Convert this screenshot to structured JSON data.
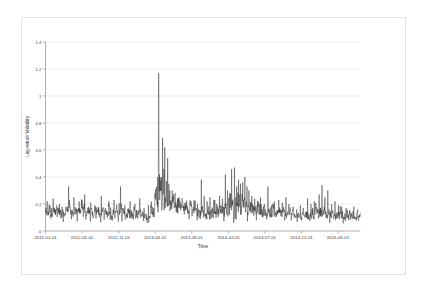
{
  "figure": {
    "background_color": "#ffffff",
    "frame_color": "#e3e3e3",
    "axis_color": "#9a9a9a",
    "grid_color": "#e9e9e9",
    "line_color": "#1a1a1a"
  },
  "chart_data": {
    "type": "line",
    "title": "",
    "xlabel": "Time",
    "ylabel": "Log-return Volatility",
    "ylim": [
      0,
      1.4
    ],
    "yticks": [
      0,
      0.2,
      0.4,
      0.6,
      0.8,
      1,
      1.2,
      1.4
    ],
    "ytick_labels": [
      "0",
      "0.2",
      "0.4",
      "0.6",
      "0.8",
      "1",
      "1.2",
      "1.4"
    ],
    "xticks": [
      0,
      152,
      305,
      456,
      608,
      762,
      912,
      1065,
      1216
    ],
    "xtick_labels": [
      "2012-01-01",
      "2012-06-01",
      "2012-11-01",
      "2013-04-01",
      "2013-09-01",
      "2014-02-01",
      "2014-07-01",
      "2014-12-01",
      "2015-05-01"
    ],
    "xlim": [
      0,
      1310
    ],
    "grid": true,
    "grid_axis": "y",
    "legend": null,
    "series": [
      {
        "name": "Log-return Volatility",
        "color": "#1a1a1a",
        "n_points": 1310,
        "sampling": "daily",
        "notes": "Dense high-frequency volatility series; baseline near 0.10-0.18 with episodic spike clusters.",
        "peak_value": 1.17,
        "peak_x": 470,
        "min_value": 0.055,
        "baseline_mean": 0.14,
        "regimes": [
          {
            "x_start": 0,
            "x_end": 150,
            "base": 0.135,
            "noise": 0.03,
            "spikes": [
              [
                32,
                0.24
              ],
              [
                58,
                0.2
              ],
              [
                96,
                0.33
              ],
              [
                118,
                0.25
              ],
              [
                140,
                0.22
              ]
            ]
          },
          {
            "x_start": 150,
            "x_end": 300,
            "base": 0.13,
            "noise": 0.028,
            "spikes": [
              [
                163,
                0.27
              ],
              [
                188,
                0.21
              ],
              [
                205,
                0.19
              ],
              [
                232,
                0.26
              ],
              [
                262,
                0.2
              ],
              [
                285,
                0.23
              ]
            ]
          },
          {
            "x_start": 300,
            "x_end": 400,
            "base": 0.118,
            "noise": 0.026,
            "spikes": [
              [
                312,
                0.33
              ],
              [
                330,
                0.19
              ],
              [
                352,
                0.22
              ],
              [
                372,
                0.2
              ],
              [
                392,
                0.24
              ]
            ]
          },
          {
            "x_start": 400,
            "x_end": 448,
            "base": 0.105,
            "noise": 0.022,
            "spikes": [
              [
                410,
                0.17
              ],
              [
                428,
                0.19
              ],
              [
                441,
                0.18
              ]
            ]
          },
          {
            "x_start": 448,
            "x_end": 470,
            "base": 0.15,
            "noise": 0.045,
            "spikes": [
              [
                455,
                0.28
              ],
              [
                462,
                0.33
              ],
              [
                467,
                0.4
              ]
            ]
          },
          {
            "x_start": 470,
            "x_end": 478,
            "base": 0.24,
            "noise": 0.07,
            "spikes": [
              [
                471,
                1.17
              ],
              [
                474,
                0.42
              ],
              [
                476,
                0.38
              ]
            ]
          },
          {
            "x_start": 478,
            "x_end": 500,
            "base": 0.215,
            "noise": 0.06,
            "spikes": [
              [
                482,
                0.4
              ],
              [
                487,
                0.69
              ],
              [
                492,
                0.46
              ],
              [
                496,
                0.62
              ]
            ]
          },
          {
            "x_start": 500,
            "x_end": 520,
            "base": 0.195,
            "noise": 0.055,
            "spikes": [
              [
                503,
                0.37
              ],
              [
                508,
                0.54
              ],
              [
                513,
                0.35
              ],
              [
                517,
                0.3
              ]
            ]
          },
          {
            "x_start": 520,
            "x_end": 570,
            "base": 0.16,
            "noise": 0.04,
            "spikes": [
              [
                527,
                0.3
              ],
              [
                538,
                0.26
              ],
              [
                549,
                0.24
              ],
              [
                560,
                0.22
              ]
            ]
          },
          {
            "x_start": 570,
            "x_end": 640,
            "base": 0.125,
            "noise": 0.028,
            "spikes": [
              [
                584,
                0.21
              ],
              [
                600,
                0.19
              ],
              [
                618,
                0.23
              ],
              [
                632,
                0.2
              ]
            ]
          },
          {
            "x_start": 640,
            "x_end": 690,
            "base": 0.135,
            "noise": 0.032,
            "spikes": [
              [
                648,
                0.38
              ],
              [
                660,
                0.26
              ],
              [
                672,
                0.22
              ],
              [
                684,
                0.25
              ]
            ]
          },
          {
            "x_start": 690,
            "x_end": 740,
            "base": 0.13,
            "noise": 0.03,
            "spikes": [
              [
                700,
                0.23
              ],
              [
                712,
                0.2
              ],
              [
                724,
                0.26
              ],
              [
                736,
                0.24
              ]
            ]
          },
          {
            "x_start": 740,
            "x_end": 780,
            "base": 0.16,
            "noise": 0.04,
            "spikes": [
              [
                748,
                0.42
              ],
              [
                757,
                0.3
              ],
              [
                766,
                0.28
              ],
              [
                774,
                0.46
              ]
            ]
          },
          {
            "x_start": 780,
            "x_end": 815,
            "base": 0.175,
            "noise": 0.045,
            "spikes": [
              [
                786,
                0.47
              ],
              [
                795,
                0.33
              ],
              [
                803,
                0.38
              ],
              [
                811,
                0.35
              ]
            ]
          },
          {
            "x_start": 815,
            "x_end": 850,
            "base": 0.165,
            "noise": 0.042,
            "spikes": [
              [
                820,
                0.36
              ],
              [
                829,
                0.4
              ],
              [
                838,
                0.33
              ],
              [
                846,
                0.3
              ]
            ]
          },
          {
            "x_start": 850,
            "x_end": 900,
            "base": 0.14,
            "noise": 0.032,
            "spikes": [
              [
                858,
                0.26
              ],
              [
                870,
                0.24
              ],
              [
                882,
                0.22
              ],
              [
                894,
                0.25
              ]
            ]
          },
          {
            "x_start": 900,
            "x_end": 960,
            "base": 0.115,
            "noise": 0.024,
            "spikes": [
              [
                910,
                0.2
              ],
              [
                925,
                0.33
              ],
              [
                940,
                0.19
              ],
              [
                952,
                0.22
              ]
            ]
          },
          {
            "x_start": 960,
            "x_end": 1020,
            "base": 0.118,
            "noise": 0.026,
            "spikes": [
              [
                970,
                0.23
              ],
              [
                985,
                0.21
              ],
              [
                1000,
                0.25
              ],
              [
                1012,
                0.2
              ]
            ]
          },
          {
            "x_start": 1020,
            "x_end": 1080,
            "base": 0.105,
            "noise": 0.022,
            "spikes": [
              [
                1030,
                0.18
              ],
              [
                1045,
                0.16
              ],
              [
                1060,
                0.19
              ],
              [
                1072,
                0.17
              ]
            ]
          },
          {
            "x_start": 1080,
            "x_end": 1130,
            "base": 0.112,
            "noise": 0.024,
            "spikes": [
              [
                1090,
                0.24
              ],
              [
                1104,
                0.2
              ],
              [
                1118,
                0.22
              ]
            ]
          },
          {
            "x_start": 1130,
            "x_end": 1180,
            "base": 0.125,
            "noise": 0.03,
            "spikes": [
              [
                1138,
                0.27
              ],
              [
                1150,
                0.34
              ],
              [
                1162,
                0.25
              ],
              [
                1174,
                0.3
              ]
            ]
          },
          {
            "x_start": 1180,
            "x_end": 1240,
            "base": 0.11,
            "noise": 0.024,
            "spikes": [
              [
                1190,
                0.2
              ],
              [
                1204,
                0.22
              ],
              [
                1218,
                0.19
              ],
              [
                1232,
                0.18
              ]
            ]
          },
          {
            "x_start": 1240,
            "x_end": 1310,
            "base": 0.095,
            "noise": 0.022,
            "spikes": [
              [
                1250,
                0.17
              ],
              [
                1266,
                0.15
              ],
              [
                1282,
                0.18
              ],
              [
                1298,
                0.14
              ]
            ]
          }
        ]
      }
    ]
  }
}
